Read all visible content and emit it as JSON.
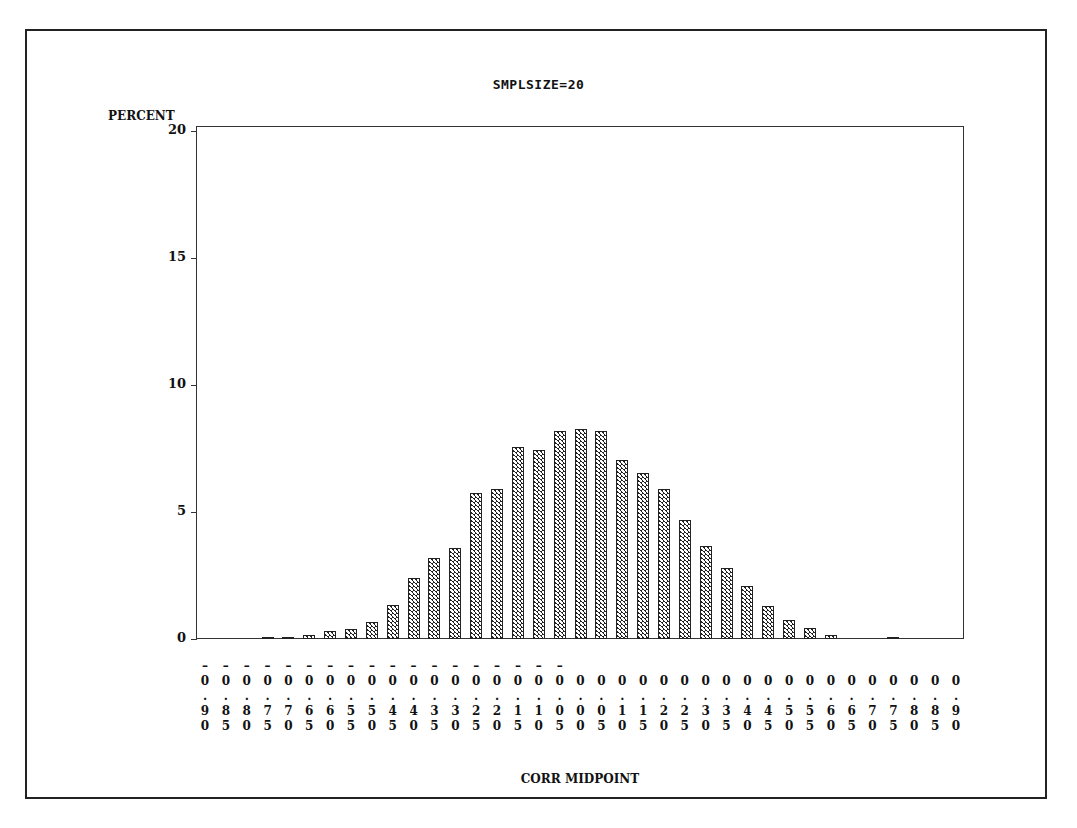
{
  "chart_data": {
    "type": "bar",
    "title": "SMPLSIZE=20",
    "xlabel": "CORR MIDPOINT",
    "ylabel": "PERCENT",
    "ylim": [
      0,
      20
    ],
    "yticks": [
      0,
      5,
      10,
      15,
      20
    ],
    "grid": false,
    "legend": null,
    "bar_pattern": "crosshatch",
    "categories": [
      "-0.90",
      "-0.85",
      "-0.80",
      "-0.75",
      "-0.70",
      "-0.65",
      "-0.60",
      "-0.55",
      "-0.50",
      "-0.45",
      "-0.40",
      "-0.35",
      "-0.30",
      "-0.25",
      "-0.20",
      "-0.15",
      "-0.10",
      "-0.05",
      "0.00",
      "0.05",
      "0.10",
      "0.15",
      "0.20",
      "0.25",
      "0.30",
      "0.35",
      "0.40",
      "0.45",
      "0.50",
      "0.55",
      "0.60",
      "0.65",
      "0.70",
      "0.75",
      "0.80",
      "0.85",
      "0.90"
    ],
    "values": [
      0,
      0,
      0,
      0.05,
      0.05,
      0.15,
      0.3,
      0.4,
      0.65,
      1.35,
      2.4,
      3.2,
      3.6,
      5.75,
      5.9,
      7.55,
      7.45,
      8.2,
      8.25,
      8.2,
      7.05,
      6.55,
      5.9,
      4.7,
      3.65,
      2.8,
      2.1,
      1.3,
      0.75,
      0.45,
      0.15,
      0,
      0,
      0.05,
      0,
      0,
      0
    ]
  },
  "labels": {
    "title": "SMPLSIZE=20",
    "ylabel": "PERCENT",
    "xlabel": "CORR MIDPOINT"
  }
}
